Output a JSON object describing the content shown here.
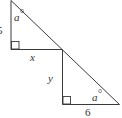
{
  "diagram": {
    "triangle_top": {
      "vertical_side_label": "5",
      "horizontal_side_label": "x",
      "angle_label": "a",
      "angle_unit": "°",
      "right_angle_marker": true
    },
    "triangle_bottom": {
      "vertical_side_label": "y",
      "horizontal_side_label": "6",
      "angle_label": "a",
      "angle_unit": "°",
      "right_angle_marker": true
    },
    "colors": {
      "line": "#3a3a3a",
      "text": "#333333",
      "background": "#ffffff"
    }
  }
}
